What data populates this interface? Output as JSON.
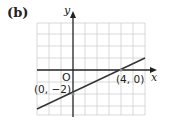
{
  "figure": {
    "part_label": "(b)",
    "x_axis_label": "x",
    "y_axis_label": "y",
    "origin_label": "O",
    "points": [
      {
        "label": "(0, −2)",
        "x": 0,
        "y": -2
      },
      {
        "label": "(4, 0)",
        "x": 4,
        "y": 0
      }
    ],
    "line": {
      "slope": 0.5,
      "intercept": -2,
      "equation": "y = x/2 − 2"
    },
    "grid": {
      "x_range": [
        -3,
        6
      ],
      "y_range": [
        -4,
        4
      ],
      "cell": 1
    }
  },
  "colors": {
    "grid": "#c8c8c8",
    "axis": "#222222",
    "line": "#333333",
    "background": "#ffffff"
  }
}
